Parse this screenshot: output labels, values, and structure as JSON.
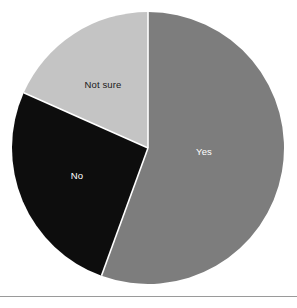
{
  "chart_data": {
    "type": "pie",
    "title": "",
    "subtitle": "",
    "xlabel": "",
    "ylabel": "",
    "grid": false,
    "legend_position": "none",
    "labels_inside_slices": true,
    "start_angle_deg": 0,
    "direction": "clockwise",
    "categories": [
      "Yes",
      "No",
      "Not sure"
    ],
    "values": [
      55.6,
      26.1,
      18.3
    ],
    "value_unit": "percent",
    "slices": [
      {
        "label": "Yes",
        "value": 55.6,
        "start_angle_deg": 0,
        "end_angle_deg": 200,
        "color": "#7d7d7d",
        "label_color": "#ffffff",
        "label_x": 204,
        "label_y": 152
      },
      {
        "label": "No",
        "value": 26.1,
        "start_angle_deg": 200,
        "end_angle_deg": 294,
        "color": "#0d0d0d",
        "label_color": "#ffffff",
        "label_x": 77,
        "label_y": 176
      },
      {
        "label": "Not sure",
        "value": 18.3,
        "start_angle_deg": 294,
        "end_angle_deg": 360,
        "color": "#c4c4c4",
        "label_color": "#1a1a1a",
        "label_x": 103,
        "label_y": 85
      }
    ],
    "geometry": {
      "center_x": 148,
      "center_y": 148,
      "radius": 136,
      "separator_color": "#ffffff",
      "separator_width": 1.6
    },
    "colors": {
      "background": "#ffffff",
      "rule": "#9a9a9a",
      "yes": "#7d7d7d",
      "no": "#0d0d0d",
      "not_sure": "#c4c4c4"
    }
  },
  "figure": {
    "rule_present": true
  }
}
